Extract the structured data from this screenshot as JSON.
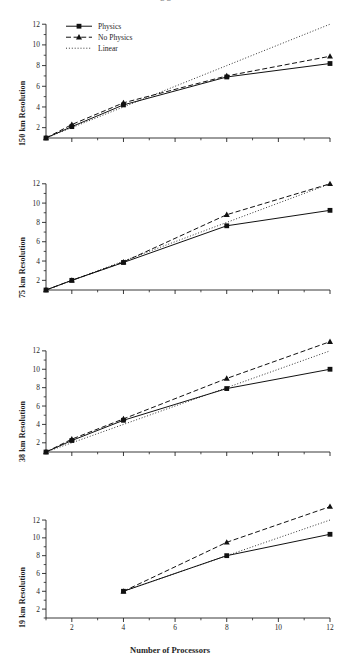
{
  "figure": {
    "cut_off_title_fragment": "g    g                                           H",
    "xlabel": "Number of Processors",
    "xticks": [
      2,
      4,
      6,
      8,
      10,
      12
    ],
    "yticks": [
      2,
      4,
      6,
      8,
      10,
      12
    ],
    "xlim": [
      1,
      12
    ],
    "ylim": [
      1,
      12.6
    ]
  },
  "legend": {
    "position": "top-left-of-first-panel",
    "items": [
      {
        "label": "Physics",
        "marker": "square-marker",
        "line": "solid-line"
      },
      {
        "label": "No Physics",
        "marker": "triangle-marker",
        "line": "dashed-line"
      },
      {
        "label": "Linear",
        "marker": "none",
        "line": "dotted-line"
      }
    ]
  },
  "chart_data": [
    {
      "type": "line",
      "title": "150 km Resolution",
      "xlabel": "Number of Processors",
      "ylabel": "150 km Resolution",
      "xlim": [
        1,
        12
      ],
      "ylim": [
        1,
        12.6
      ],
      "xticks": [
        2,
        4,
        6,
        8,
        10,
        12
      ],
      "yticks": [
        2,
        4,
        6,
        8,
        10,
        12
      ],
      "grid": false,
      "legend": "upper left",
      "x": [
        1,
        2,
        4,
        8,
        12
      ],
      "series": [
        {
          "name": "Physics",
          "values": [
            1,
            2.1,
            4.2,
            6.9,
            8.2
          ]
        },
        {
          "name": "No Physics",
          "values": [
            1,
            2.3,
            4.4,
            7.0,
            8.9
          ]
        },
        {
          "name": "Linear",
          "values": [
            1,
            2,
            4,
            8,
            12
          ]
        }
      ]
    },
    {
      "type": "line",
      "title": "75 km Resolution",
      "xlabel": "Number of Processors",
      "ylabel": "75 km Resolution",
      "xlim": [
        1,
        12
      ],
      "ylim": [
        1,
        12.6
      ],
      "xticks": [
        2,
        4,
        6,
        8,
        10,
        12
      ],
      "yticks": [
        2,
        4,
        6,
        8,
        10,
        12
      ],
      "grid": false,
      "legend": "none",
      "x": [
        1,
        2,
        4,
        8,
        12
      ],
      "series": [
        {
          "name": "Physics",
          "values": [
            1,
            2.0,
            3.85,
            7.65,
            9.25
          ]
        },
        {
          "name": "No Physics",
          "values": [
            1,
            2.0,
            3.9,
            8.8,
            12.0
          ]
        },
        {
          "name": "Linear",
          "values": [
            1,
            2,
            4,
            8,
            12
          ]
        }
      ]
    },
    {
      "type": "line",
      "title": "38 km Resolution",
      "xlabel": "Number of Processors",
      "ylabel": "38 km Resolution",
      "xlim": [
        1,
        12
      ],
      "ylim": [
        1,
        13.4
      ],
      "xticks": [
        2,
        4,
        6,
        8,
        10,
        12
      ],
      "yticks": [
        2,
        4,
        6,
        8,
        10,
        12
      ],
      "grid": false,
      "legend": "none",
      "x": [
        1,
        2,
        4,
        8,
        12
      ],
      "series": [
        {
          "name": "Physics",
          "values": [
            1,
            2.25,
            4.45,
            7.9,
            10.0
          ]
        },
        {
          "name": "No Physics",
          "values": [
            1,
            2.4,
            4.6,
            9.0,
            13.0
          ]
        },
        {
          "name": "Linear",
          "values": [
            1,
            2,
            4,
            8,
            12
          ]
        }
      ]
    },
    {
      "type": "line",
      "title": "19 km Resolution",
      "xlabel": "Number of Processors",
      "ylabel": "19 km Resolution",
      "xlim": [
        1,
        12
      ],
      "ylim": [
        1,
        13.8
      ],
      "xticks": [
        2,
        4,
        6,
        8,
        10,
        12
      ],
      "yticks": [
        2,
        4,
        6,
        8,
        10,
        12
      ],
      "grid": false,
      "legend": "none",
      "x": [
        4,
        8,
        12
      ],
      "series": [
        {
          "name": "Physics",
          "values": [
            4.0,
            8.0,
            10.4
          ]
        },
        {
          "name": "No Physics",
          "values": [
            4.0,
            9.5,
            13.5
          ]
        },
        {
          "name": "Linear",
          "values": [
            4,
            8,
            12
          ]
        }
      ]
    }
  ]
}
